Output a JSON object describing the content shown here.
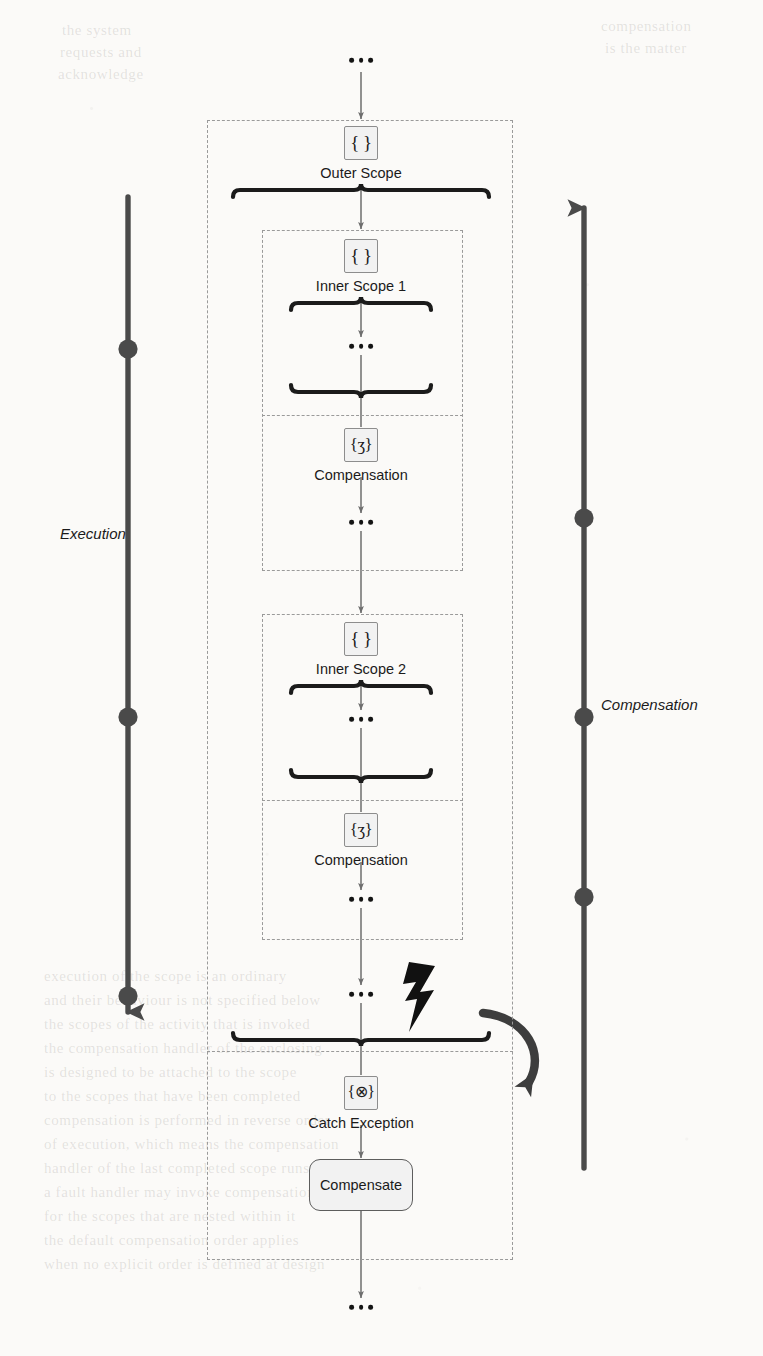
{
  "diagram": {
    "type": "bpmn-compensation-flow",
    "lanes": [
      {
        "id": "execution",
        "label": "Execution",
        "direction": "down",
        "side": "left",
        "markers": 3
      },
      {
        "id": "compensation",
        "label": "Compensation",
        "direction": "up",
        "side": "right",
        "markers": 3
      }
    ],
    "flow_start_ellipsis": "…",
    "flow_end_ellipsis": "…",
    "scopes": [
      {
        "id": "outer-scope",
        "label": "Outer Scope",
        "icon_glyph": "{ }",
        "icon_name": "scope-icon"
      },
      {
        "id": "inner-scope-1",
        "label": "Inner Scope 1",
        "icon_glyph": "{ }",
        "icon_name": "scope-icon",
        "body_ellipsis": "…",
        "compensation": {
          "label": "Compensation",
          "icon_glyph": "{ʒ}",
          "icon_name": "compensation-icon",
          "body_ellipsis": "…"
        }
      },
      {
        "id": "inner-scope-2",
        "label": "Inner Scope 2",
        "icon_glyph": "{ }",
        "icon_name": "scope-icon",
        "body_ellipsis": "…",
        "compensation": {
          "label": "Compensation",
          "icon_glyph": "{ʒ}",
          "icon_name": "compensation-icon",
          "body_ellipsis": "…"
        }
      }
    ],
    "outer_body_ellipsis": "…",
    "exception": {
      "fault_icon_name": "lightning-bolt-icon",
      "redirect_arrow_name": "curved-redirect-arrow",
      "handler": {
        "label": "Catch Exception",
        "icon_glyph": "{⊗}",
        "icon_name": "catch-exception-icon"
      },
      "task": {
        "label": "Compensate"
      }
    },
    "colors": {
      "stroke": "#1b1b1b",
      "dash_stroke": "#9a9a9a",
      "icon_fill": "#f2f2f2",
      "icon_border": "#8d8d8d",
      "lane_stroke": "#4a4a4a",
      "connector": "#6e6e6e"
    }
  },
  "background_bleed": [
    {
      "text": "the system",
      "x": 62,
      "y": 22
    },
    {
      "text": "requests and",
      "x": 60,
      "y": 44
    },
    {
      "text": "acknowledge",
      "x": 58,
      "y": 66
    },
    {
      "text": "compensation",
      "x": 601,
      "y": 18
    },
    {
      "text": "is the matter",
      "x": 605,
      "y": 40
    },
    {
      "text": "execution of the scope is an ordinary",
      "x": 44,
      "y": 968
    },
    {
      "text": "and their behaviour is not specified below",
      "x": 44,
      "y": 992
    },
    {
      "text": "the scopes of the activity that is invoked",
      "x": 44,
      "y": 1016
    },
    {
      "text": "the compensation handler of the enclosing",
      "x": 44,
      "y": 1040
    },
    {
      "text": "is designed to be attached to the scope",
      "x": 44,
      "y": 1064
    },
    {
      "text": "to the scopes that have been completed",
      "x": 44,
      "y": 1088
    },
    {
      "text": "compensation is performed in reverse order",
      "x": 44,
      "y": 1112
    },
    {
      "text": "of execution, which means the compensation",
      "x": 44,
      "y": 1136
    },
    {
      "text": "handler of the last completed scope runs first",
      "x": 44,
      "y": 1160
    },
    {
      "text": "a fault handler may invoke compensation",
      "x": 44,
      "y": 1184
    },
    {
      "text": "for the scopes that are nested within it",
      "x": 44,
      "y": 1208
    },
    {
      "text": "the default compensation order applies",
      "x": 44,
      "y": 1232
    },
    {
      "text": "when no explicit order is defined at design",
      "x": 44,
      "y": 1256
    }
  ]
}
